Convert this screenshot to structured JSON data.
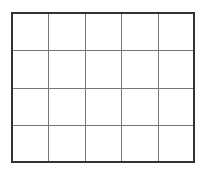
{
  "diagram": {
    "type": "grid",
    "columns": 5,
    "rows": 4,
    "cells": [
      [
        "",
        "",
        "",
        "",
        ""
      ],
      [
        "",
        "",
        "",
        "",
        ""
      ],
      [
        "",
        "",
        "",
        "",
        ""
      ],
      [
        "",
        "",
        "",
        "",
        ""
      ]
    ],
    "colors": {
      "background": "#ffffff",
      "outer_border": "#333333",
      "inner_lines": "#777777"
    }
  }
}
